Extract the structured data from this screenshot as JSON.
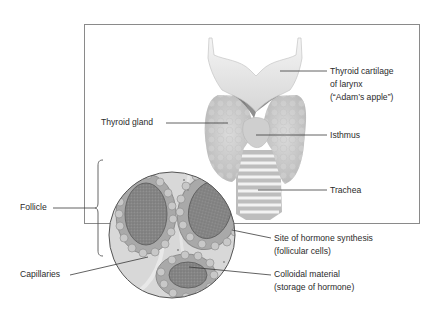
{
  "diagram": {
    "labels": {
      "thyroid_cartilage": [
        "Thyroid cartilage",
        "of larynx",
        "(“Adam’s apple”)"
      ],
      "thyroid_gland": "Thyroid gland",
      "isthmus": "Isthmus",
      "trachea": "Trachea",
      "follicle": "Follicle",
      "hormone_site": [
        "Site of hormone synthesis",
        "(follicular cells)"
      ],
      "capillaries": "Capillaries",
      "colloid": [
        "Colloidal material",
        "(storage of hormone)"
      ]
    },
    "colors": {
      "frame": "#8a8a8a",
      "leader_line": "#3a3a3a",
      "cartilage": "#e4e4e4",
      "gland": "#c9c9c9",
      "trachea_light": "#f0f0f0",
      "trachea_dark": "#bdbdbd",
      "colloid": "#7e7e7e",
      "cell": "#b0b0b0",
      "circle_bg": "#d8d8d8"
    }
  }
}
